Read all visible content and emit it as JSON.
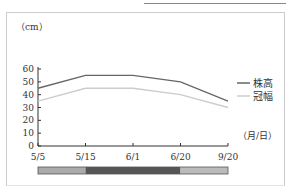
{
  "chart_data": {
    "type": "line",
    "title": "",
    "ylabel": "（cm）",
    "xlabel": "（月/日）",
    "categories": [
      "5/5",
      "5/15",
      "6/1",
      "6/20",
      "9/20"
    ],
    "yticks": [
      0,
      10,
      20,
      30,
      40,
      50,
      60
    ],
    "ylim": [
      0,
      60
    ],
    "grid": false,
    "legend_position": "right",
    "series": [
      {
        "name": "株高",
        "values": [
          45,
          55,
          55,
          50,
          35
        ],
        "color": "#666666"
      },
      {
        "name": "冠幅",
        "values": [
          35,
          45,
          45,
          40,
          30
        ],
        "color": "#cccccc"
      }
    ],
    "stage_bar": [
      {
        "from": "5/5",
        "to": "5/15",
        "color": "#aaaaaa"
      },
      {
        "from": "5/15",
        "to": "6/20",
        "color": "#555555"
      },
      {
        "from": "6/20",
        "to": "9/20",
        "color": "#bbbbbb"
      }
    ]
  }
}
